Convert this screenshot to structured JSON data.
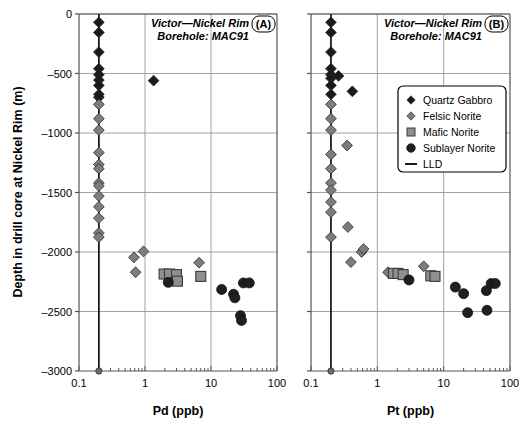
{
  "figure": {
    "ylabel": "Depth in drill core at Nickel Rim (m)",
    "ytick_labels": [
      "0",
      "–500",
      "–1000",
      "–1500",
      "–2000",
      "–2500",
      "–3000"
    ],
    "ytick_values": [
      0,
      -500,
      -1000,
      -1500,
      -2000,
      -2500,
      -3000
    ],
    "xtick_labels": [
      "0.1",
      "1",
      "10",
      "100"
    ],
    "xtick_values": [
      0.1,
      1,
      10,
      100
    ],
    "colors": {
      "quartz_gabbro": "#1a1a1a",
      "felsic_norite": "#7d7d7d",
      "mafic_norite": "#8f8f8f",
      "sublayer_norite": "#1f1f1f",
      "lld": "#000000",
      "grid": "#999999",
      "axis": "#555555"
    },
    "legend": {
      "items": [
        {
          "label": "Quartz Gabbro",
          "marker": "diamond-dark-icon"
        },
        {
          "label": "Felsic Norite",
          "marker": "diamond-gray-icon"
        },
        {
          "label": "Mafic Norite",
          "marker": "square-gray-icon"
        },
        {
          "label": "Sublayer Norite",
          "marker": "circle-dark-icon"
        },
        {
          "label": "LLD",
          "marker": "line-icon"
        }
      ]
    }
  },
  "panelA": {
    "tag": "(A)",
    "title_line1": "Victor—Nickel Rim",
    "title_line2": "Borehole: MAC91",
    "xlabel": "Pd (ppb)"
  },
  "panelB": {
    "tag": "(B)",
    "title_line1": "Victor—Nickel Rim",
    "title_line2": "Borehole: MAC91",
    "xlabel": "Pt (ppb)"
  },
  "chart_data": [
    {
      "type": "scatter",
      "panel": "A",
      "title": "Victor—Nickel Rim Borehole: MAC91",
      "xlabel": "Pd (ppb)",
      "ylabel": "Depth in drill core at Nickel Rim (m)",
      "xscale": "log",
      "xlim": [
        0.1,
        100
      ],
      "ylim": [
        -3000,
        0
      ],
      "grid": true,
      "legend_position": "none",
      "lld_value": 0.2,
      "series": [
        {
          "name": "Quartz Gabbro",
          "marker": "diamond",
          "color": "#1a1a1a",
          "points": [
            {
              "x": 0.2,
              "y": -70
            },
            {
              "x": 0.2,
              "y": -155
            },
            {
              "x": 0.2,
              "y": -320
            },
            {
              "x": 0.2,
              "y": -460
            },
            {
              "x": 0.2,
              "y": -510
            },
            {
              "x": 0.2,
              "y": -555
            },
            {
              "x": 0.2,
              "y": -600
            },
            {
              "x": 0.2,
              "y": -675
            },
            {
              "x": 0.2,
              "y": -700
            },
            {
              "x": 1.35,
              "y": -560
            }
          ]
        },
        {
          "name": "Felsic Norite",
          "marker": "diamond",
          "color": "#7d7d7d",
          "points": [
            {
              "x": 0.2,
              "y": -760
            },
            {
              "x": 0.2,
              "y": -880
            },
            {
              "x": 0.2,
              "y": -975
            },
            {
              "x": 0.2,
              "y": -1165
            },
            {
              "x": 0.2,
              "y": -1265
            },
            {
              "x": 0.2,
              "y": -1300
            },
            {
              "x": 0.2,
              "y": -1420
            },
            {
              "x": 0.2,
              "y": -1445
            },
            {
              "x": 0.2,
              "y": -1530
            },
            {
              "x": 0.2,
              "y": -1620
            },
            {
              "x": 0.2,
              "y": -1715
            },
            {
              "x": 0.2,
              "y": -1840
            },
            {
              "x": 0.2,
              "y": -1875
            },
            {
              "x": 0.95,
              "y": -1995
            },
            {
              "x": 0.68,
              "y": -2045
            },
            {
              "x": 0.72,
              "y": -2170
            },
            {
              "x": 6.6,
              "y": -2090
            }
          ]
        },
        {
          "name": "Mafic Norite",
          "marker": "square",
          "color": "#8f8f8f",
          "points": [
            {
              "x": 1.95,
              "y": -2185
            },
            {
              "x": 2.35,
              "y": -2185
            },
            {
              "x": 3.0,
              "y": -2190
            },
            {
              "x": 3.1,
              "y": -2245
            },
            {
              "x": 7.0,
              "y": -2205
            }
          ]
        },
        {
          "name": "Sublayer Norite",
          "marker": "circle",
          "color": "#1f1f1f",
          "points": [
            {
              "x": 2.25,
              "y": -2255
            },
            {
              "x": 14.5,
              "y": -2315
            },
            {
              "x": 22.0,
              "y": -2355
            },
            {
              "x": 23.0,
              "y": -2385
            },
            {
              "x": 31.0,
              "y": -2260
            },
            {
              "x": 38.0,
              "y": -2260
            },
            {
              "x": 28.0,
              "y": -2535
            },
            {
              "x": 29.0,
              "y": -2575
            }
          ]
        }
      ]
    },
    {
      "type": "scatter",
      "panel": "B",
      "title": "Victor—Nickel Rim Borehole: MAC91",
      "xlabel": "Pt (ppb)",
      "ylabel": "Depth in drill core at Nickel Rim (m)",
      "xscale": "log",
      "xlim": [
        0.1,
        100
      ],
      "ylim": [
        -3000,
        0
      ],
      "grid": true,
      "legend_position": "upper-right",
      "lld_value": 0.2,
      "series": [
        {
          "name": "Quartz Gabbro",
          "marker": "diamond",
          "color": "#1a1a1a",
          "points": [
            {
              "x": 0.2,
              "y": -70
            },
            {
              "x": 0.2,
              "y": -155
            },
            {
              "x": 0.2,
              "y": -320
            },
            {
              "x": 0.2,
              "y": -460
            },
            {
              "x": 0.2,
              "y": -510
            },
            {
              "x": 0.2,
              "y": -540
            },
            {
              "x": 0.26,
              "y": -520
            },
            {
              "x": 0.2,
              "y": -600
            },
            {
              "x": 0.2,
              "y": -675
            },
            {
              "x": 0.42,
              "y": -650
            }
          ]
        },
        {
          "name": "Felsic Norite",
          "marker": "diamond",
          "color": "#7d7d7d",
          "points": [
            {
              "x": 0.2,
              "y": -760
            },
            {
              "x": 0.2,
              "y": -880
            },
            {
              "x": 0.2,
              "y": -975
            },
            {
              "x": 0.35,
              "y": -1105
            },
            {
              "x": 0.2,
              "y": -1180
            },
            {
              "x": 0.2,
              "y": -1300
            },
            {
              "x": 0.2,
              "y": -1420
            },
            {
              "x": 0.2,
              "y": -1480
            },
            {
              "x": 0.2,
              "y": -1580
            },
            {
              "x": 0.2,
              "y": -1665
            },
            {
              "x": 0.36,
              "y": -1790
            },
            {
              "x": 0.2,
              "y": -1875
            },
            {
              "x": 0.58,
              "y": -2000
            },
            {
              "x": 0.62,
              "y": -1975
            },
            {
              "x": 0.4,
              "y": -2085
            },
            {
              "x": 1.45,
              "y": -2170
            },
            {
              "x": 5.0,
              "y": -2120
            }
          ]
        },
        {
          "name": "Mafic Norite",
          "marker": "square",
          "color": "#8f8f8f",
          "points": [
            {
              "x": 1.75,
              "y": -2180
            },
            {
              "x": 2.05,
              "y": -2180
            },
            {
              "x": 2.45,
              "y": -2190
            },
            {
              "x": 6.4,
              "y": -2200
            },
            {
              "x": 7.4,
              "y": -2205
            }
          ]
        },
        {
          "name": "Sublayer Norite",
          "marker": "circle",
          "color": "#1f1f1f",
          "points": [
            {
              "x": 3.0,
              "y": -2235
            },
            {
              "x": 15.0,
              "y": -2295
            },
            {
              "x": 20.0,
              "y": -2350
            },
            {
              "x": 44.0,
              "y": -2325
            },
            {
              "x": 52.0,
              "y": -2265
            },
            {
              "x": 60.0,
              "y": -2265
            },
            {
              "x": 23.0,
              "y": -2510
            },
            {
              "x": 45.0,
              "y": -2490
            }
          ]
        }
      ]
    }
  ]
}
